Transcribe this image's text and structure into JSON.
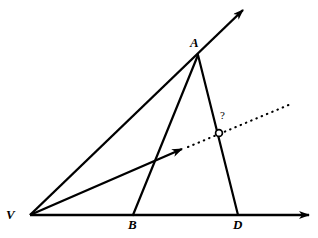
{
  "figure": {
    "background_color": "#ffffff",
    "stroke_color": "#000000",
    "width": 318,
    "height": 238
  },
  "points": [
    {
      "id": "V",
      "label": "V",
      "x": 30,
      "y": 215,
      "label_x": 6,
      "label_y": 209,
      "marker": "none"
    },
    {
      "id": "A",
      "label": "A",
      "x": 198,
      "y": 55,
      "label_x": 190,
      "label_y": 38,
      "marker": "none"
    },
    {
      "id": "B",
      "label": "B",
      "x": 133,
      "y": 215,
      "label_x": 128,
      "label_y": 219,
      "marker": "none"
    },
    {
      "id": "D",
      "label": "D",
      "x": 238,
      "y": 215,
      "label_x": 233,
      "label_y": 219,
      "marker": "none"
    },
    {
      "id": "P",
      "label": "?",
      "x": 219,
      "y": 133,
      "label_x": 219,
      "label_y": 111,
      "marker": "open-circle"
    }
  ],
  "segments": [
    {
      "name": "ray-VA-extended",
      "from": "V",
      "to": "arrow-upper",
      "x1": 30,
      "y1": 215,
      "x2": 243,
      "y2": 10,
      "style": "solid",
      "arrow": "end"
    },
    {
      "name": "baseline-VD-extended",
      "from": "V",
      "to": "arrow-right",
      "x1": 30,
      "y1": 215,
      "x2": 309,
      "y2": 215,
      "style": "solid",
      "arrow": "end"
    },
    {
      "name": "segment-AB",
      "from": "A",
      "to": "B",
      "x1": 198,
      "y1": 55,
      "x2": 133,
      "y2": 215,
      "style": "solid",
      "arrow": "none"
    },
    {
      "name": "segment-AD",
      "from": "A",
      "to": "D",
      "x1": 198,
      "y1": 55,
      "x2": 238,
      "y2": 215,
      "style": "solid",
      "arrow": "none"
    },
    {
      "name": "ray-bisector-solid",
      "from": "V",
      "to": "arrow-mid",
      "x1": 30,
      "y1": 215,
      "x2": 182,
      "y2": 149,
      "style": "solid",
      "arrow": "end"
    },
    {
      "name": "ray-bisector-dotted",
      "from": "arrow-mid",
      "to": "dotted-end",
      "x1": 186,
      "y1": 147,
      "x2": 291,
      "y2": 104,
      "style": "dotted",
      "arrow": "none"
    }
  ],
  "annotations": {
    "unknown_point_label": "?",
    "marker_radius": 3.5
  },
  "labels": {
    "V": "V",
    "A": "A",
    "B": "B",
    "D": "D",
    "query": "?"
  }
}
